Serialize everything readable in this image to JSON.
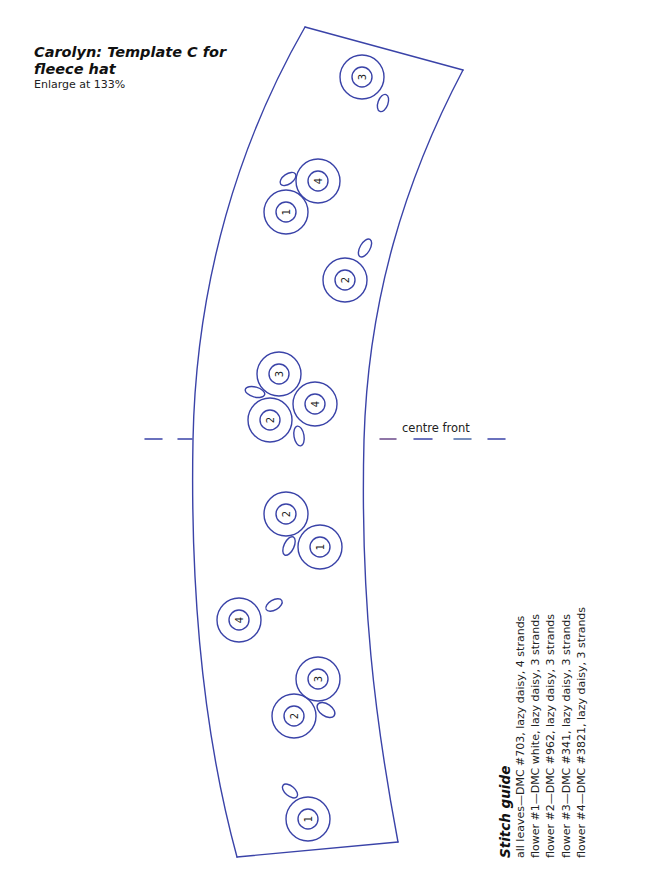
{
  "header": {
    "title_line1": "Carolyn: Template C for",
    "title_line2": "fleece hat",
    "subtitle": "Enlarge at 133%"
  },
  "pattern": {
    "line_color": "#3a43a8",
    "marker_label": "centre front",
    "flowers": [
      {
        "id": "f1",
        "number": "3",
        "x": 362,
        "y": 77,
        "leaf": {
          "x": 383,
          "y": 103,
          "rx": 5,
          "ry": 9,
          "rot": 20
        }
      },
      {
        "id": "f2",
        "number": "4",
        "x": 318,
        "y": 181,
        "leaf": {
          "x": 288,
          "y": 179,
          "rx": 9,
          "ry": 5,
          "rot": -35
        }
      },
      {
        "id": "f3",
        "number": "1",
        "x": 286,
        "y": 212,
        "leaf": null
      },
      {
        "id": "f4",
        "number": "2",
        "x": 345,
        "y": 280,
        "leaf": {
          "x": 365,
          "y": 248,
          "rx": 5,
          "ry": 10,
          "rot": 30
        }
      },
      {
        "id": "f5",
        "number": "3",
        "x": 279,
        "y": 374,
        "leaf": {
          "x": 255,
          "y": 392,
          "rx": 10,
          "ry": 5,
          "rot": 15
        }
      },
      {
        "id": "f6",
        "number": "2",
        "x": 270,
        "y": 420,
        "leaf": null
      },
      {
        "id": "f7",
        "number": "4",
        "x": 315,
        "y": 404,
        "leaf": {
          "x": 299,
          "y": 436,
          "rx": 5,
          "ry": 10,
          "rot": -10
        }
      },
      {
        "id": "f8",
        "number": "2",
        "x": 286,
        "y": 514,
        "leaf": {
          "x": 289,
          "y": 546,
          "rx": 5,
          "ry": 10,
          "rot": 25
        }
      },
      {
        "id": "f9",
        "number": "1",
        "x": 320,
        "y": 547,
        "leaf": null
      },
      {
        "id": "f10",
        "number": "4",
        "x": 239,
        "y": 620,
        "leaf": {
          "x": 274,
          "y": 605,
          "rx": 9,
          "ry": 5,
          "rot": -30
        }
      },
      {
        "id": "f11",
        "number": "3",
        "x": 318,
        "y": 679,
        "leaf": {
          "x": 326,
          "y": 710,
          "rx": 10,
          "ry": 6,
          "rot": 35
        }
      },
      {
        "id": "f12",
        "number": "2",
        "x": 294,
        "y": 716,
        "leaf": null
      },
      {
        "id": "f13",
        "number": "1",
        "x": 308,
        "y": 819,
        "leaf": {
          "x": 290,
          "y": 791,
          "rx": 9,
          "ry": 5,
          "rot": 40
        }
      }
    ]
  },
  "stitch_guide": {
    "title": "Stitch guide",
    "lines": [
      "all leaves—DMC #703, lazy daisy, 4 strands",
      "flower #1—DMC white, lazy daisy, 3 strands",
      "flower #2—DMC #962, lazy daisy, 3 strands",
      "flower #3—DMC #341, lazy daisy, 3 strands",
      "flower #4—DMC #3821, lazy daisy, 3 strands"
    ]
  }
}
